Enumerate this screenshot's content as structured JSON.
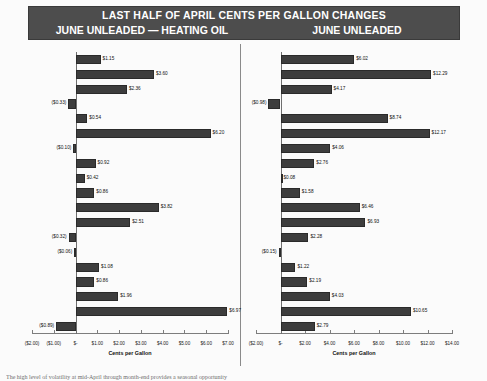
{
  "banner": {
    "title": "LAST HALF OF APRIL CENTS PER GALLON CHANGES",
    "subtitle_left": "JUNE UNLEADED — HEATING OIL",
    "subtitle_right": "JUNE UNLEADED"
  },
  "years": [
    "2006",
    "2005",
    "2004",
    "2003",
    "2002",
    "2001",
    "2000",
    "1999",
    "1998",
    "1997",
    "1996",
    "1995",
    "1994",
    "1993",
    "1992",
    "1991",
    "1990",
    "1989",
    "1988"
  ],
  "footer_note": "The high level of volatility at mid-April through month-end provides a seasonal opportunity",
  "colors": {
    "bar": "#3d3d3d",
    "banner_bg": "#4d4d4d",
    "panel_bg": "#fbfbfb",
    "axis": "#7d7d7d"
  },
  "chart_data": [
    {
      "type": "bar",
      "name": "june-unleaded-minus-heating-oil",
      "title": "JUNE UNLEADED — HEATING OIL",
      "orientation": "horizontal",
      "xlabel": "Cents per Gallon",
      "ylabel": "",
      "xlim": [
        -2.0,
        7.0
      ],
      "xticks": [
        -2.0,
        -1.0,
        0,
        1.0,
        2.0,
        3.0,
        4.0,
        5.0,
        6.0,
        7.0
      ],
      "xticklabels": [
        "($2.00)",
        "($1.00)",
        "$-",
        "$1.00",
        "$2.00",
        "$3.00",
        "$4.00",
        "$5.00",
        "$6.00",
        "$7.00"
      ],
      "grid": false,
      "legend": "none",
      "categories": [
        "2006",
        "2005",
        "2004",
        "2003",
        "2002",
        "2001",
        "2000",
        "1999",
        "1998",
        "1997",
        "1996",
        "1995",
        "1994",
        "1993",
        "1992",
        "1991",
        "1990",
        "1989",
        "1988"
      ],
      "values": [
        1.15,
        3.6,
        2.36,
        -0.33,
        0.54,
        6.2,
        -0.1,
        0.92,
        0.42,
        0.86,
        3.82,
        2.51,
        -0.32,
        -0.06,
        1.08,
        0.86,
        1.96,
        6.97,
        -0.89
      ],
      "data_labels": [
        "$1.15",
        "$3.60",
        "$2.36",
        "($0.33)",
        "$0.54",
        "$6.20",
        "($0.10)",
        "$0.92",
        "$0.42",
        "$0.86",
        "$3.82",
        "$2.51",
        "($0.32)",
        "($0.06)",
        "$1.08",
        "$0.86",
        "$1.96",
        "$6.97",
        "($0.89)"
      ]
    },
    {
      "type": "bar",
      "name": "june-unleaded",
      "title": "JUNE UNLEADED",
      "orientation": "horizontal",
      "xlabel": "Cents per Gallon",
      "ylabel": "",
      "xlim": [
        -2.0,
        14.0
      ],
      "xticks": [
        -2.0,
        0,
        2.0,
        4.0,
        6.0,
        8.0,
        10.0,
        12.0,
        14.0
      ],
      "xticklabels": [
        "($2.00)",
        "$-",
        "$2.00",
        "$4.00",
        "$6.00",
        "$8.00",
        "$10.00",
        "$12.00",
        "$14.00"
      ],
      "grid": false,
      "legend": "none",
      "categories": [
        "2006",
        "2005",
        "2004",
        "2003",
        "2002",
        "2001",
        "2000",
        "1999",
        "1998",
        "1997",
        "1996",
        "1995",
        "1994",
        "1993",
        "1992",
        "1991",
        "1990",
        "1989",
        "1988"
      ],
      "values": [
        6.02,
        12.29,
        4.17,
        -0.98,
        8.74,
        12.17,
        4.06,
        2.76,
        0.08,
        1.58,
        6.46,
        6.93,
        2.28,
        -0.15,
        1.22,
        2.19,
        4.03,
        10.65,
        2.79
      ],
      "data_labels": [
        "$6.02",
        "$12.29",
        "$4.17",
        "($0.98)",
        "$8.74",
        "$12.17",
        "$4.06",
        "$2.76",
        "$0.08",
        "$1.58",
        "$6.46",
        "$6.93",
        "$2.28",
        "($0.15)",
        "$1.22",
        "$2.19",
        "$4.03",
        "$10.65",
        "$2.79"
      ]
    }
  ]
}
